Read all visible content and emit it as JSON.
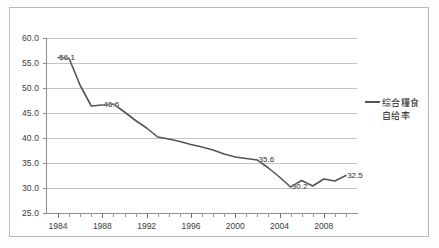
{
  "chart_data": {
    "type": "line",
    "title": "",
    "xlabel": "",
    "ylabel": "",
    "xlim": [
      1983,
      2011
    ],
    "ylim": [
      25.0,
      60.0
    ],
    "grid": true,
    "legend_position": "right",
    "y_ticks": [
      "60.0",
      "55.0",
      "50.0",
      "45.0",
      "40.0",
      "35.0",
      "30.0",
      "25.0"
    ],
    "y_tick_values": [
      60.0,
      55.0,
      50.0,
      45.0,
      40.0,
      35.0,
      30.0,
      25.0
    ],
    "x_ticks": [
      "1984",
      "1988",
      "1992",
      "1996",
      "2000",
      "2004",
      "2008"
    ],
    "x_tick_values": [
      1984,
      1988,
      1992,
      1996,
      2000,
      2004,
      2008
    ],
    "x_minor_tick_step": 1,
    "series": [
      {
        "name": "综合糧食自给率",
        "color": "#555555",
        "x": [
          1984,
          1985,
          1986,
          1987,
          1988,
          1989,
          1990,
          1991,
          1992,
          1993,
          1994,
          1995,
          1996,
          1997,
          1998,
          1999,
          2000,
          2001,
          2002,
          2003,
          2004,
          2005,
          2006,
          2007,
          2008,
          2009,
          2010
        ],
        "values": [
          56.1,
          55.9,
          50.5,
          46.4,
          46.6,
          46.8,
          45.2,
          43.5,
          42.0,
          40.2,
          39.8,
          39.3,
          38.7,
          38.2,
          37.6,
          36.8,
          36.2,
          35.9,
          35.6,
          34.0,
          32.2,
          30.2,
          31.5,
          30.4,
          31.8,
          31.4,
          32.5
        ]
      }
    ],
    "data_labels": [
      {
        "x": 1984,
        "y": 56.1,
        "text": "56.1"
      },
      {
        "x": 1988,
        "y": 46.6,
        "text": "46.6"
      },
      {
        "x": 2002,
        "y": 35.6,
        "text": "35.6"
      },
      {
        "x": 2005,
        "y": 30.2,
        "text": "30.2"
      },
      {
        "x": 2010,
        "y": 32.5,
        "text": "32.5"
      }
    ]
  },
  "legend": {
    "entries": [
      {
        "label_line1": "综合糧食",
        "label_line2": "自给率",
        "marker": "line-swatch",
        "color": "#555555"
      }
    ]
  }
}
